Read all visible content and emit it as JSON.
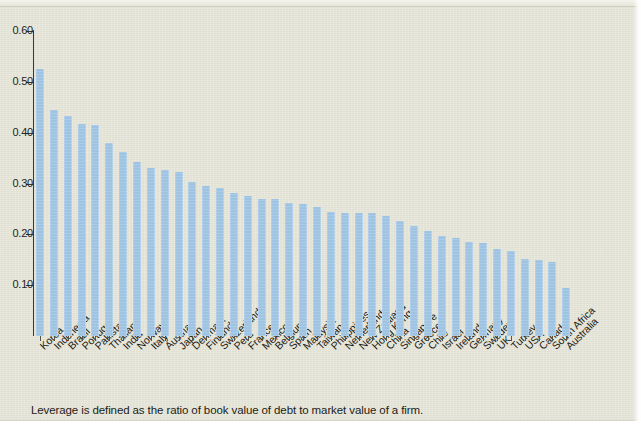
{
  "figure": {
    "caption": "Leverage is defined as the ratio of book value of debt to market value of a firm.",
    "background_color": "#e6e5d8",
    "bar_color": "#9ec3e3",
    "axis_color": "#3a3a32"
  },
  "chart_data": {
    "type": "bar",
    "title": "",
    "subtitle": "",
    "xlabel": "",
    "ylabel": "",
    "ylim": [
      0,
      0.6
    ],
    "ytick_labels": [
      "0.60",
      "0.50",
      "0.40",
      "0.30",
      "0.20",
      "0.10"
    ],
    "ytick_values": [
      0.6,
      0.5,
      0.4,
      0.3,
      0.2,
      0.1
    ],
    "grid": false,
    "legend": null,
    "categories": [
      "Korea",
      "Indonesia",
      "Brazil",
      "Portugal",
      "Pakistan",
      "Thailand",
      "India",
      "Norway",
      "Italy",
      "Austria",
      "Japan",
      "Denmark",
      "Finland",
      "Switzerland",
      "Peru",
      "France",
      "Mexico",
      "Belgium",
      "Spain",
      "Malaysia",
      "Taiwan",
      "Philippines",
      "Netherlands",
      "New Zealand",
      "Hong Kong",
      "China",
      "Singapore",
      "Greece",
      "Chile",
      "Israel",
      "Ireland",
      "Germany",
      "Sweden",
      "UK",
      "Turkey",
      "USA",
      "Canada",
      "South Africa",
      "Australia"
    ],
    "values": [
      0.525,
      0.445,
      0.432,
      0.417,
      0.416,
      0.38,
      0.361,
      0.343,
      0.331,
      0.327,
      0.323,
      0.302,
      0.296,
      0.291,
      0.282,
      0.275,
      0.27,
      0.27,
      0.262,
      0.259,
      0.253,
      0.244,
      0.242,
      0.241,
      0.241,
      0.237,
      0.227,
      0.216,
      0.207,
      0.196,
      0.192,
      0.185,
      0.182,
      0.172,
      0.168,
      0.152,
      0.15,
      0.145,
      0.095
    ]
  }
}
